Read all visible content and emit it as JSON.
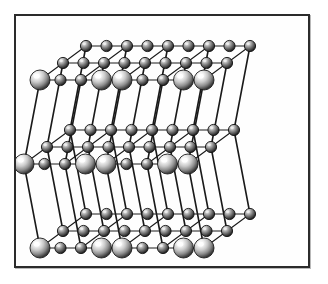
{
  "figure": {
    "caption": "",
    "background_color": "#ffffff",
    "frame": {
      "name": "figure-border",
      "x": 14,
      "y": 14,
      "width": 296,
      "height": 254,
      "border_color": "#2b2b2b",
      "border_width": 2,
      "fill_color": "#fefefe"
    }
  },
  "structure": {
    "type": "rock-salt-cubic-lattice",
    "layers": 3,
    "rows_per_layer": 3,
    "columns_per_row": 5,
    "projection": "oblique",
    "bond_color": "#1a1a1a",
    "bond_width": 1.1,
    "vertical_bond_width": 1.6,
    "atom_types": [
      {
        "key": "large",
        "label": "large cation sphere",
        "radius": 10,
        "highlight_color": "#ffffff",
        "mid_color": "#b8b8b8",
        "edge_color": "#1c1c1c"
      },
      {
        "key": "small",
        "label": "small anion sphere",
        "radius": 5.6,
        "highlight_color": "#efefef",
        "mid_color": "#8d8d8d",
        "edge_color": "#121212"
      }
    ],
    "geometry": {
      "col_dx": 41,
      "row_dx": -23,
      "row_dy": 17,
      "layer_dy": 84,
      "origin_x": 86,
      "origin_y": 46,
      "layer_shift_x": [
        0,
        -16,
        0
      ],
      "half_cell_dx": 20.5,
      "half_cell_row_dx": -11.5,
      "half_cell_row_dy": 8.5
    }
  },
  "chart_data": {
    "type": "scatter",
    "xlabel": "",
    "ylabel": "",
    "legend": [],
    "series": [
      {
        "name": "large spheres",
        "count": 18
      },
      {
        "name": "small spheres",
        "count": 63
      }
    ]
  }
}
